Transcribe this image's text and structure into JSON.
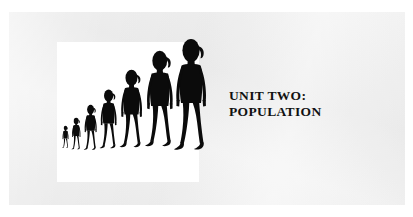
{
  "slide": {
    "background_color": "#eeeeee",
    "page_color": "#ffffff",
    "title_lines": [
      "UNIT TWO:",
      "POPULATION"
    ],
    "title_line_1": "UNIT TWO:",
    "title_line_2": "POPULATION",
    "title_color": "#111111"
  },
  "picture": {
    "panel_color": "#ffffff",
    "figure_color": "#000000",
    "caption": "",
    "figure_count": 7,
    "figures": [
      {
        "name": "figure-1-smallest",
        "scale": 0.2
      },
      {
        "name": "figure-2",
        "scale": 0.28
      },
      {
        "name": "figure-3",
        "scale": 0.4
      },
      {
        "name": "figure-4",
        "scale": 0.53
      },
      {
        "name": "figure-5",
        "scale": 0.7
      },
      {
        "name": "figure-6",
        "scale": 0.86
      },
      {
        "name": "figure-7-largest",
        "scale": 1.0
      }
    ]
  }
}
